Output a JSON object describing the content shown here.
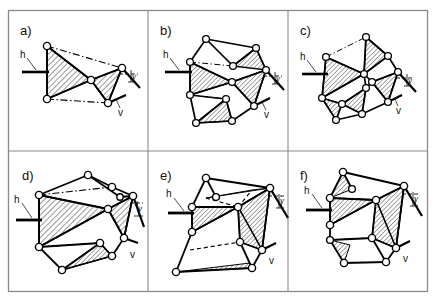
{
  "figure": {
    "type": "scientific-line-diagram",
    "background_color": "#ffffff",
    "frame_color": "#8a8a8a",
    "line_color": "#000000",
    "vertex_fill": "#ffffff",
    "hatch_color": "#000000",
    "grid": {
      "rows": 2,
      "cols": 3
    },
    "frame": {
      "x": 8,
      "y": 10,
      "width": 420,
      "height": 282
    }
  },
  "annotations": {
    "h_label": "h",
    "v_label": "v",
    "gamma_label": "γ"
  },
  "panels": [
    {
      "id": "a",
      "label": "a)",
      "h": "h",
      "v": "v",
      "gamma": "γ"
    },
    {
      "id": "b",
      "label": "b)",
      "h": "h",
      "v": "v",
      "gamma": "γ"
    },
    {
      "id": "c",
      "label": "c)",
      "h": "h",
      "v": "v",
      "gamma": "γ"
    },
    {
      "id": "d",
      "label": "d)",
      "h": "h",
      "v": "v",
      "gamma": "γ"
    },
    {
      "id": "e",
      "label": "e)",
      "h": "h",
      "v": "v",
      "gamma": "γ"
    },
    {
      "id": "f",
      "label": "f)",
      "h": "h",
      "v": "v",
      "gamma": "γ"
    }
  ]
}
